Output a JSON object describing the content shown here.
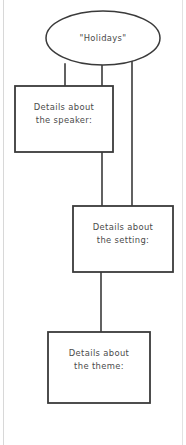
{
  "document": {
    "type": "hand-drawn graphic organizer",
    "background_color": "#ffffff",
    "ink_color": "#3a3a3a",
    "text_color": "#4a4a4a"
  },
  "diagram": {
    "title_node": {
      "shape": "ellipse",
      "text": "\"Holidays\"",
      "cx": 103,
      "cy": 38,
      "rx": 57,
      "ry": 27
    },
    "boxes": [
      {
        "id": "speaker",
        "name": "details-about-the-speaker-box",
        "line1": "Details about",
        "line2": "the speaker:",
        "x": 15,
        "y": 86,
        "width": 98,
        "height": 66
      },
      {
        "id": "setting",
        "name": "details-about-the-setting-box",
        "line1": "Details about",
        "line2": "the setting:",
        "x": 73,
        "y": 206,
        "width": 100,
        "height": 66
      },
      {
        "id": "theme",
        "name": "details-about-the-theme-box",
        "line1": "Details about",
        "line2": "the theme:",
        "x": 48,
        "y": 332,
        "width": 102,
        "height": 71
      }
    ],
    "connectors": [
      {
        "id": "ellipse-to-speaker",
        "from": "title_node",
        "to": "speaker",
        "x": 65,
        "y1": 64,
        "y2": 86
      },
      {
        "id": "ellipse-to-setting",
        "from": "title_node",
        "to": "setting",
        "x": 102,
        "y1": 64,
        "y2": 206
      },
      {
        "id": "ellipse-right-to-setting",
        "from": "title_node",
        "to": "setting",
        "x": 132,
        "y1": 60,
        "y2": 206
      },
      {
        "id": "setting-to-theme",
        "from": "setting",
        "to": "theme",
        "x": 101,
        "y1": 272,
        "y2": 332
      }
    ]
  }
}
